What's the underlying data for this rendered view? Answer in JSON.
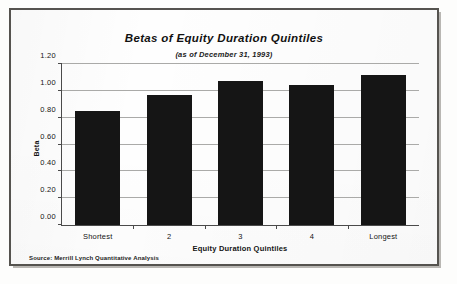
{
  "chart_data": {
    "type": "bar",
    "title": "Betas of Equity Duration Quintiles",
    "subtitle": "(as of December 31, 1993)",
    "categories": [
      "Shortest",
      "2",
      "3",
      "4",
      "Longest"
    ],
    "values": [
      0.85,
      0.97,
      1.07,
      1.04,
      1.12
    ],
    "series": [
      {
        "name": "Beta",
        "values": [
          0.85,
          0.97,
          1.07,
          1.04,
          1.12
        ]
      }
    ],
    "xlabel": "Equity Duration Quintiles",
    "ylabel": "Beta",
    "ylim": [
      0.0,
      1.2
    ],
    "ytick_values": [
      0.0,
      0.2,
      0.4,
      0.6,
      0.8,
      1.0,
      1.2
    ],
    "ytick_labels": [
      "0.00",
      "0.20",
      "0.40",
      "0.60",
      "0.80",
      "1.00",
      "1.20"
    ],
    "grid": true,
    "legend": false,
    "legend_position": "none",
    "bar_color": "#151515",
    "source": "Source: Merrill Lynch Quantitative Analysis"
  }
}
